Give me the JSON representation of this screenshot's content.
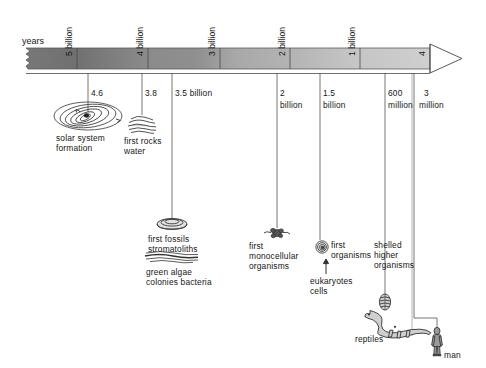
{
  "figure": {
    "type": "geological-timeline",
    "axis_label": "years",
    "scale_note": "billions of years before present, left = oldest"
  },
  "axis": {
    "ticks": [
      {
        "label": "5 billion",
        "value_byr": 5.0,
        "x": 77
      },
      {
        "label": "4 billion",
        "value_byr": 4.0,
        "x": 148
      },
      {
        "label": "3 billion",
        "value_byr": 3.0,
        "x": 220
      },
      {
        "label": "2 billion",
        "value_byr": 2.0,
        "x": 290
      },
      {
        "label": "1 billion",
        "value_byr": 1.0,
        "x": 360
      },
      {
        "label": "4",
        "value_byr": 0.0,
        "x": 430
      }
    ]
  },
  "events": [
    {
      "id": "solar-system",
      "age_label": "4.6",
      "age_byr": 4.6,
      "caption_line1": "solar system",
      "caption_line2": "formation",
      "icon": "spiral-galaxy-icon"
    },
    {
      "id": "first-rocks",
      "age_label": "3.8",
      "age_byr": 3.8,
      "caption_line1": "first rocks",
      "caption_line2": "water",
      "icon": "rock-strata-icon"
    },
    {
      "id": "first-fossils",
      "age_label": "3.5 billion",
      "age_byr": 3.5,
      "caption_line1": "first fossils",
      "caption_line2": "stromatoliths",
      "caption_line3": "green algae",
      "caption_line4": "colonies bacteria",
      "icon": "stromatolith-icon",
      "icon2": "algae-layers-icon"
    },
    {
      "id": "first-monocellular",
      "age_label_line1": "2",
      "age_label_line2": "billion",
      "age_byr": 2.0,
      "caption_line1": "first",
      "caption_line2": "monocellular",
      "caption_line3": "organisms",
      "icon": "bacterium-icon"
    },
    {
      "id": "first-eukaryotes",
      "age_label_line1": "1.5",
      "age_label_line2": "billion",
      "age_byr": 1.5,
      "caption_line1": "first",
      "caption_line2": "organisms",
      "caption_line3": "eukaryotes",
      "caption_line4": "cells",
      "icon": "eukaryote-cell-icon",
      "arrow": "up-arrow-icon"
    },
    {
      "id": "shelled-organisms",
      "age_label_line1": "600",
      "age_label_line2": "million",
      "age_byr": 0.6,
      "caption_line1": "shelled",
      "caption_line2": "higher",
      "caption_line3": "organisms",
      "icon": "shell-icon"
    },
    {
      "id": "reptiles",
      "caption_line1": "reptiles",
      "icon": "dinosaur-icon"
    },
    {
      "id": "man",
      "age_label_line1": "3",
      "age_label_line2": "million",
      "age_byr": 0.003,
      "caption_line1": "man",
      "icon": "human-figure-icon"
    }
  ],
  "colors": {
    "bar_dark": "#6f6f6f",
    "bar_light": "#c9c9c9",
    "line": "#4a4a4a",
    "text": "#161616",
    "background": "#ffffff"
  }
}
